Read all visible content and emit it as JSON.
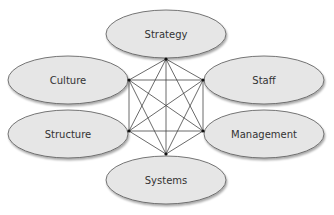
{
  "diagram": {
    "type": "fully-connected network",
    "node_fill": "#e6e6e6",
    "node_stroke": "#555555",
    "line_color": "#444444",
    "nodes": [
      {
        "id": "strategy",
        "label": "Strategy",
        "cx": 166,
        "cy": 34,
        "rx": 60,
        "ry": 24,
        "anchor": [
          166,
          59
        ]
      },
      {
        "id": "culture",
        "label": "Culture",
        "cx": 68,
        "cy": 80,
        "rx": 60,
        "ry": 24,
        "anchor": [
          129,
          80
        ]
      },
      {
        "id": "staff",
        "label": "Staff",
        "cx": 264,
        "cy": 80,
        "rx": 60,
        "ry": 24,
        "anchor": [
          203,
          80
        ]
      },
      {
        "id": "structure",
        "label": "Structure",
        "cx": 68,
        "cy": 134,
        "rx": 60,
        "ry": 24,
        "anchor": [
          129,
          131
        ]
      },
      {
        "id": "management",
        "label": "Management",
        "cx": 264,
        "cy": 134,
        "rx": 60,
        "ry": 24,
        "anchor": [
          203,
          131
        ]
      },
      {
        "id": "systems",
        "label": "Systems",
        "cx": 166,
        "cy": 180,
        "rx": 60,
        "ry": 24,
        "anchor": [
          166,
          154
        ]
      }
    ]
  }
}
